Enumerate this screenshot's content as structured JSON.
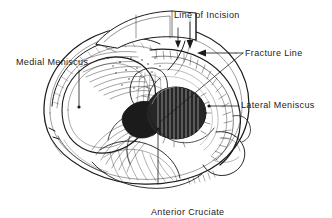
{
  "figure": {
    "kind": "medical-line-drawing",
    "background_color": "#ffffff",
    "ink_color": "#1b1b1b",
    "width": 332,
    "height": 218
  },
  "labels": {
    "medial_meniscus": "Medial Meniscus",
    "line_of_incision": "Line of Incision",
    "fracture_line": "Fracture Line",
    "lateral_meniscus": "Lateral Meniscus",
    "anterior_cruciate_ligament_line1": "Anterior Cruciate",
    "anterior_cruciate_ligament_line2": "Ligament"
  },
  "leaders": {
    "medial_meniscus": "vertical line from label down to medial meniscus rim, dot terminator",
    "line_of_incision": "two short vertical arrows pointing down to the incision",
    "fracture_line": "short horizontal stub left of label, plus arrow pointing left and long diagonal to fracture",
    "lateral_meniscus": "horizontal line from label left to lateral meniscus, dot terminator",
    "anterior_cruciate_ligament": "vertical line from label up to ACL insertion, dot terminator"
  }
}
